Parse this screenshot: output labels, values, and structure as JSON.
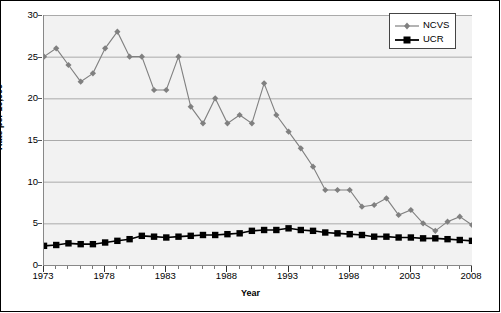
{
  "chart_data": {
    "type": "line",
    "title": "",
    "xlabel": "Year",
    "ylabel": "Rate per 10,000",
    "xlim": [
      1973,
      2008
    ],
    "ylim": [
      0,
      30
    ],
    "ytick_labels": [
      "0",
      "5",
      "10",
      "15",
      "20",
      "25",
      "30"
    ],
    "ytick_values": [
      0,
      5,
      10,
      15,
      20,
      25,
      30
    ],
    "xtick_labels": [
      "1973",
      "1978",
      "1983",
      "1988",
      "1993",
      "1998",
      "2003",
      "2008"
    ],
    "xtick_values": [
      1973,
      1978,
      1983,
      1988,
      1993,
      1998,
      2003,
      2008
    ],
    "grid": "horizontal",
    "legend_position": "top-right",
    "x": [
      1973,
      1974,
      1975,
      1976,
      1977,
      1978,
      1979,
      1980,
      1981,
      1982,
      1983,
      1984,
      1985,
      1986,
      1987,
      1988,
      1989,
      1990,
      1991,
      1992,
      1993,
      1994,
      1995,
      1996,
      1997,
      1998,
      1999,
      2000,
      2001,
      2002,
      2003,
      2004,
      2005,
      2006,
      2007,
      2008
    ],
    "series": [
      {
        "name": "NCVS",
        "color": "#808080",
        "marker": "diamond",
        "values": [
          25.0,
          26.0,
          24.0,
          22.0,
          23.0,
          26.0,
          28.0,
          25.0,
          25.0,
          21.0,
          21.0,
          25.0,
          19.0,
          17.0,
          20.0,
          17.0,
          18.0,
          17.0,
          21.8,
          18.0,
          16.0,
          14.0,
          11.8,
          9.0,
          9.0,
          9.0,
          7.0,
          7.2,
          8.0,
          6.0,
          6.6,
          5.0,
          4.1,
          5.2,
          5.8,
          4.8
        ]
      },
      {
        "name": "UCR",
        "color": "#000000",
        "marker": "square",
        "values": [
          2.3,
          2.4,
          2.6,
          2.5,
          2.5,
          2.7,
          2.9,
          3.1,
          3.5,
          3.4,
          3.3,
          3.4,
          3.5,
          3.6,
          3.6,
          3.7,
          3.8,
          4.1,
          4.2,
          4.2,
          4.4,
          4.2,
          4.1,
          3.9,
          3.8,
          3.7,
          3.6,
          3.4,
          3.4,
          3.3,
          3.3,
          3.2,
          3.2,
          3.1,
          3.0,
          2.9
        ]
      }
    ],
    "legend": [
      {
        "label": "NCVS",
        "color": "#808080",
        "marker": "diamond"
      },
      {
        "label": "UCR",
        "color": "#000000",
        "marker": "square"
      }
    ]
  }
}
